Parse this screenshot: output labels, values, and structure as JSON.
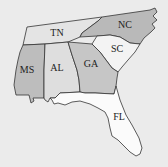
{
  "map": {
    "region": "Southeastern United States",
    "states": [
      {
        "id": "TN",
        "label": "TN",
        "fill": "#e4e4e4"
      },
      {
        "id": "NC",
        "label": "NC",
        "fill": "#b9b9b9"
      },
      {
        "id": "SC",
        "label": "SC",
        "fill": "#f3f3f3"
      },
      {
        "id": "MS",
        "label": "MS",
        "fill": "#bdbdbd"
      },
      {
        "id": "AL",
        "label": "AL",
        "fill": "#dedede"
      },
      {
        "id": "GA",
        "label": "GA",
        "fill": "#c6c6c6"
      },
      {
        "id": "FL",
        "label": "FL",
        "fill": "#fbfbfb"
      }
    ]
  }
}
